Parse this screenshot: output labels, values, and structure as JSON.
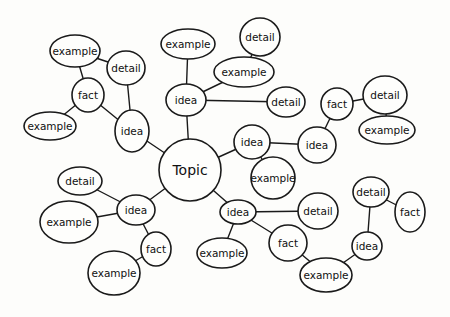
{
  "diagram": {
    "type": "mind-map",
    "colors": {
      "background": "#fdfdfb",
      "stroke": "#1a1a1a",
      "text": "#111111"
    },
    "nodes": [
      {
        "id": "topic",
        "label": "Topic",
        "cx": 190,
        "cy": 170,
        "rx": 31,
        "ry": 31
      },
      {
        "id": "idea1",
        "label": "idea",
        "cx": 186,
        "cy": 100,
        "rx": 20,
        "ry": 16
      },
      {
        "id": "ex1",
        "label": "example",
        "cx": 188,
        "cy": 44,
        "rx": 27,
        "ry": 15
      },
      {
        "id": "ex2",
        "label": "example",
        "cx": 244,
        "cy": 72,
        "rx": 30,
        "ry": 15
      },
      {
        "id": "det1",
        "label": "detail",
        "cx": 260,
        "cy": 37,
        "rx": 20,
        "ry": 19
      },
      {
        "id": "det2",
        "label": "detail",
        "cx": 286,
        "cy": 102,
        "rx": 19,
        "ry": 15
      },
      {
        "id": "idea2",
        "label": "idea",
        "cx": 132,
        "cy": 131,
        "rx": 17,
        "ry": 21
      },
      {
        "id": "det3",
        "label": "detail",
        "cx": 126,
        "cy": 68,
        "rx": 19,
        "ry": 17
      },
      {
        "id": "ex3",
        "label": "example",
        "cx": 75,
        "cy": 51,
        "rx": 25,
        "ry": 16
      },
      {
        "id": "fact1",
        "label": "fact",
        "cx": 88,
        "cy": 95,
        "rx": 16,
        "ry": 17
      },
      {
        "id": "ex4",
        "label": "example",
        "cx": 50,
        "cy": 126,
        "rx": 26,
        "ry": 14
      },
      {
        "id": "idea3",
        "label": "idea",
        "cx": 252,
        "cy": 142,
        "rx": 18,
        "ry": 17
      },
      {
        "id": "ex5",
        "label": "example",
        "cx": 273,
        "cy": 178,
        "rx": 22,
        "ry": 21
      },
      {
        "id": "idea4",
        "label": "idea",
        "cx": 317,
        "cy": 145,
        "rx": 19,
        "ry": 18
      },
      {
        "id": "fact2",
        "label": "fact",
        "cx": 337,
        "cy": 104,
        "rx": 16,
        "ry": 16
      },
      {
        "id": "det4",
        "label": "detail",
        "cx": 385,
        "cy": 95,
        "rx": 22,
        "ry": 19
      },
      {
        "id": "ex6",
        "label": "example",
        "cx": 387,
        "cy": 130,
        "rx": 28,
        "ry": 14
      },
      {
        "id": "idea5",
        "label": "idea",
        "cx": 136,
        "cy": 210,
        "rx": 19,
        "ry": 15
      },
      {
        "id": "det5",
        "label": "detail",
        "cx": 80,
        "cy": 181,
        "rx": 22,
        "ry": 14
      },
      {
        "id": "ex7",
        "label": "example",
        "cx": 69,
        "cy": 222,
        "rx": 29,
        "ry": 21
      },
      {
        "id": "fact3",
        "label": "fact",
        "cx": 156,
        "cy": 249,
        "rx": 15,
        "ry": 17
      },
      {
        "id": "ex8",
        "label": "example",
        "cx": 114,
        "cy": 273,
        "rx": 26,
        "ry": 22
      },
      {
        "id": "idea6",
        "label": "idea",
        "cx": 238,
        "cy": 212,
        "rx": 18,
        "ry": 12
      },
      {
        "id": "ex9",
        "label": "example",
        "cx": 222,
        "cy": 253,
        "rx": 25,
        "ry": 15
      },
      {
        "id": "det6",
        "label": "detail",
        "cx": 318,
        "cy": 211,
        "rx": 20,
        "ry": 18
      },
      {
        "id": "fact4",
        "label": "fact",
        "cx": 288,
        "cy": 243,
        "rx": 19,
        "ry": 18
      },
      {
        "id": "ex10",
        "label": "example",
        "cx": 326,
        "cy": 275,
        "rx": 26,
        "ry": 17
      },
      {
        "id": "idea7",
        "label": "idea",
        "cx": 367,
        "cy": 246,
        "rx": 15,
        "ry": 14
      },
      {
        "id": "det7",
        "label": "detail",
        "cx": 371,
        "cy": 192,
        "rx": 18,
        "ry": 15
      },
      {
        "id": "fact5",
        "label": "fact",
        "cx": 410,
        "cy": 212,
        "rx": 15,
        "ry": 20
      }
    ],
    "edges": [
      [
        "topic",
        "idea1"
      ],
      [
        "idea1",
        "ex1"
      ],
      [
        "idea1",
        "ex2"
      ],
      [
        "ex2",
        "det1"
      ],
      [
        "idea1",
        "det2"
      ],
      [
        "topic",
        "idea2"
      ],
      [
        "idea2",
        "det3"
      ],
      [
        "det3",
        "ex3"
      ],
      [
        "idea2",
        "fact1"
      ],
      [
        "fact1",
        "ex3"
      ],
      [
        "fact1",
        "ex4"
      ],
      [
        "topic",
        "idea3"
      ],
      [
        "idea3",
        "ex5"
      ],
      [
        "idea3",
        "idea4"
      ],
      [
        "idea4",
        "fact2"
      ],
      [
        "fact2",
        "det4"
      ],
      [
        "det4",
        "ex6"
      ],
      [
        "topic",
        "idea5"
      ],
      [
        "idea5",
        "det5"
      ],
      [
        "idea5",
        "ex7"
      ],
      [
        "idea5",
        "fact3"
      ],
      [
        "fact3",
        "ex8"
      ],
      [
        "topic",
        "idea6"
      ],
      [
        "idea6",
        "ex9"
      ],
      [
        "idea6",
        "det6"
      ],
      [
        "idea6",
        "fact4"
      ],
      [
        "fact4",
        "ex10"
      ],
      [
        "ex10",
        "idea7"
      ],
      [
        "idea7",
        "det7"
      ],
      [
        "det7",
        "fact5"
      ]
    ]
  }
}
